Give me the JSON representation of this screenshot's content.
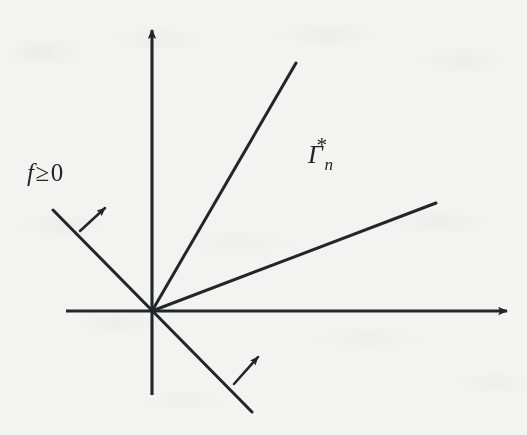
{
  "figure": {
    "width": 527,
    "height": 435,
    "background_color": "#f3f3f2",
    "ink_color": "#23252a"
  },
  "labels": {
    "f_nonneg": {
      "function_symbol": "f",
      "relation": "≥",
      "value": "0",
      "full_text": "f≥0"
    },
    "gamma_star_n": {
      "base": "Γ",
      "subscript": "n",
      "superscript": "*",
      "full_text": "Γ*n"
    }
  },
  "axes": {
    "origin": {
      "x": 152,
      "y": 311
    },
    "x_axis": {
      "name": "horizontal-axis",
      "from": {
        "x": 66,
        "y": 311
      },
      "to": {
        "x": 513,
        "y": 311
      },
      "arrow_at": "right"
    },
    "y_axis": {
      "name": "vertical-axis",
      "from": {
        "x": 152,
        "y": 395
      },
      "to": {
        "x": 152,
        "y": 22
      },
      "arrow_at": "top"
    }
  },
  "rays": [
    {
      "name": "cone-upper-boundary-ray",
      "from": {
        "x": 152,
        "y": 311
      },
      "to": {
        "x": 296,
        "y": 63
      },
      "angle_deg": 59.9
    },
    {
      "name": "cone-lower-boundary-ray",
      "from": {
        "x": 152,
        "y": 311
      },
      "to": {
        "x": 436,
        "y": 203
      },
      "angle_deg": 20.8
    }
  ],
  "constraint_line": {
    "name": "f-nonneg-boundary-line",
    "from": {
      "x": 53,
      "y": 210
    },
    "to": {
      "x": 252,
      "y": 412
    },
    "angle_deg": -45.4,
    "passes_through_origin": true
  },
  "direction_arrows": [
    {
      "name": "feasible-direction-arrow-upper",
      "from": {
        "x": 80,
        "y": 231
      },
      "to": {
        "x": 110,
        "y": 203
      }
    },
    {
      "name": "feasible-direction-arrow-lower",
      "from": {
        "x": 234,
        "y": 384
      },
      "to": {
        "x": 263,
        "y": 352
      }
    }
  ]
}
